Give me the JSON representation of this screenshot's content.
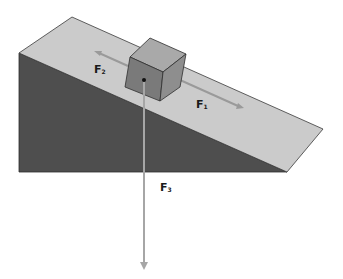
{
  "diagram": {
    "colors": {
      "ramp_top": "#cbcbcb",
      "ramp_side": "#4e4e4e",
      "cube_top": "#a9a9a9",
      "cube_front": "#7a7a7a",
      "cube_right": "#8e8e8e",
      "arrow": "#9a9a9a",
      "edge": "#3a3a3a"
    },
    "forces": [
      {
        "id": "F1",
        "label": "F",
        "subscript": "1",
        "direction": "down-slope"
      },
      {
        "id": "F2",
        "label": "F",
        "subscript": "2",
        "direction": "up-slope"
      },
      {
        "id": "F3",
        "label": "F",
        "subscript": "3",
        "direction": "vertical-down"
      }
    ]
  }
}
